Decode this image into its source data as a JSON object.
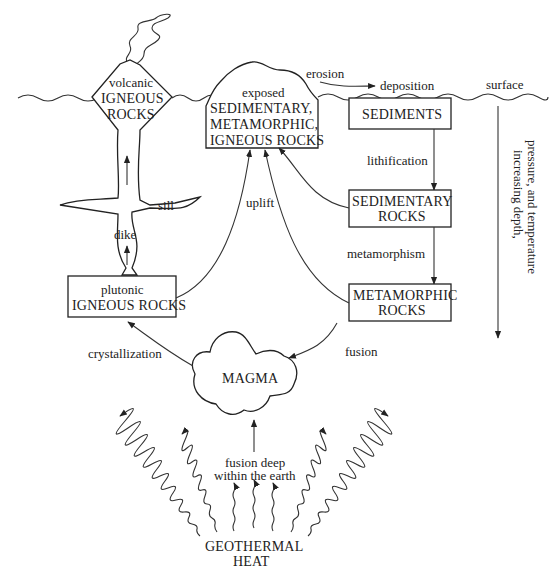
{
  "surface_label": "surface",
  "depth_axis": {
    "line1": "increasing depth,",
    "line2": "pressure, and temperature"
  },
  "nodes": {
    "volcanic": {
      "line1": "volcanic",
      "line2": "IGNEOUS",
      "line3": "ROCKS"
    },
    "exposed": {
      "line1": "exposed",
      "line2": "SEDIMENTARY,",
      "line3": "METAMORPHIC,",
      "line4": "IGNEOUS ROCKS"
    },
    "sediments": {
      "line1": "SEDIMENTS"
    },
    "sedimentary_rocks": {
      "line1": "SEDIMENTARY",
      "line2": "ROCKS"
    },
    "metamorphic_rocks": {
      "line1": "METAMORPHIC",
      "line2": "ROCKS"
    },
    "plutonic": {
      "line1": "plutonic",
      "line2": "IGNEOUS ROCKS"
    },
    "magma": {
      "line1": "MAGMA"
    },
    "geothermal": {
      "line1": "GEOTHERMAL",
      "line2": "HEAT"
    }
  },
  "process_labels": {
    "erosion": "erosion",
    "deposition": "deposition",
    "lithification": "lithification",
    "metamorphism": "metamorphism",
    "fusion": "fusion",
    "uplift": "uplift",
    "crystallization": "crystallization",
    "sill": "sill",
    "dike": "dike",
    "fusion_deep_line1": "fusion deep",
    "fusion_deep_line2": "within the earth"
  },
  "colors": {
    "line": "#222222",
    "background": "#ffffff"
  }
}
